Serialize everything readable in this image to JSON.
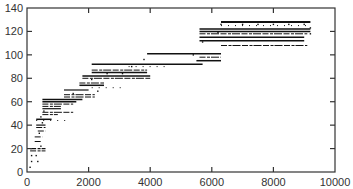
{
  "chart_data": {
    "type": "scatter",
    "title": "",
    "xlabel": "",
    "ylabel": "",
    "xlim": [
      0,
      10000
    ],
    "ylim": [
      0,
      140
    ],
    "grid": false,
    "legend": null,
    "x_ticks": [
      0,
      2000,
      4000,
      6000,
      8000,
      10000
    ],
    "y_ticks": [
      0,
      20,
      40,
      60,
      80,
      100,
      120,
      140
    ],
    "x_tick_labels": [
      "0",
      "2000",
      "4000",
      "6000",
      "8000",
      "10000"
    ],
    "y_tick_labels": [
      "0",
      "20",
      "40",
      "60",
      "80",
      "100",
      "120",
      "140"
    ],
    "segments": [
      {
        "y": 128,
        "x_start": 6300,
        "x_end": 9200,
        "style": "solid",
        "weight": 2
      },
      {
        "y": 125,
        "x_start": 6300,
        "x_end": 9200,
        "style": "dots",
        "weight": 1
      },
      {
        "y": 122,
        "x_start": 5600,
        "x_end": 9200,
        "style": "solid",
        "weight": 1.5
      },
      {
        "y": 120,
        "x_start": 5600,
        "x_end": 9200,
        "style": "solid",
        "weight": 1.5
      },
      {
        "y": 118,
        "x_start": 5600,
        "x_end": 9100,
        "style": "dashed",
        "weight": 1
      },
      {
        "y": 115,
        "x_start": 5600,
        "x_end": 9000,
        "style": "solid",
        "weight": 1.5
      },
      {
        "y": 112,
        "x_start": 5600,
        "x_end": 9000,
        "style": "solid",
        "weight": 1.5
      },
      {
        "y": 108,
        "x_start": 6300,
        "x_end": 9100,
        "style": "dashed",
        "weight": 1
      },
      {
        "y": 101,
        "x_start": 3900,
        "x_end": 6300,
        "style": "solid",
        "weight": 1.5
      },
      {
        "y": 98,
        "x_start": 5600,
        "x_end": 6300,
        "style": "dashed",
        "weight": 1
      },
      {
        "y": 95,
        "x_start": 5500,
        "x_end": 6300,
        "style": "solid",
        "weight": 1.5
      },
      {
        "y": 92,
        "x_start": 2100,
        "x_end": 5700,
        "style": "solid",
        "weight": 1.5
      },
      {
        "y": 90,
        "x_start": 3300,
        "x_end": 4500,
        "style": "dots",
        "weight": 1
      },
      {
        "y": 87,
        "x_start": 2100,
        "x_end": 3900,
        "style": "dashed",
        "weight": 1
      },
      {
        "y": 85,
        "x_start": 2100,
        "x_end": 3900,
        "style": "solid",
        "weight": 1.5
      },
      {
        "y": 82,
        "x_start": 1800,
        "x_end": 4000,
        "style": "solid",
        "weight": 1.5
      },
      {
        "y": 80,
        "x_start": 1800,
        "x_end": 4000,
        "style": "dashed",
        "weight": 1
      },
      {
        "y": 76,
        "x_start": 1700,
        "x_end": 2500,
        "style": "dashed",
        "weight": 1
      },
      {
        "y": 74,
        "x_start": 1700,
        "x_end": 2500,
        "style": "solid",
        "weight": 1.5
      },
      {
        "y": 72,
        "x_start": 2100,
        "x_end": 3200,
        "style": "dots",
        "weight": 1
      },
      {
        "y": 70,
        "x_start": 1200,
        "x_end": 2000,
        "style": "solid",
        "weight": 1.2
      },
      {
        "y": 66,
        "x_start": 1200,
        "x_end": 2200,
        "style": "dashed",
        "weight": 1
      },
      {
        "y": 64,
        "x_start": 1200,
        "x_end": 2200,
        "style": "dashed",
        "weight": 1
      },
      {
        "y": 62,
        "x_start": 500,
        "x_end": 1800,
        "style": "solid",
        "weight": 1.5
      },
      {
        "y": 60,
        "x_start": 500,
        "x_end": 1600,
        "style": "solid",
        "weight": 1.5
      },
      {
        "y": 58,
        "x_start": 500,
        "x_end": 1500,
        "style": "dashed",
        "weight": 1
      },
      {
        "y": 56,
        "x_start": 500,
        "x_end": 1100,
        "style": "dashed",
        "weight": 1
      },
      {
        "y": 54,
        "x_start": 500,
        "x_end": 1100,
        "style": "solid",
        "weight": 1.2
      },
      {
        "y": 51,
        "x_start": 500,
        "x_end": 1500,
        "style": "dashed",
        "weight": 1
      },
      {
        "y": 49,
        "x_start": 500,
        "x_end": 1000,
        "style": "dashed",
        "weight": 1
      },
      {
        "y": 45,
        "x_start": 300,
        "x_end": 800,
        "style": "solid",
        "weight": 1.5
      },
      {
        "y": 44,
        "x_start": 300,
        "x_end": 1400,
        "style": "dots",
        "weight": 1
      },
      {
        "y": 40,
        "x_start": 300,
        "x_end": 600,
        "style": "solid",
        "weight": 1.2
      },
      {
        "y": 38,
        "x_start": 300,
        "x_end": 600,
        "style": "dashed",
        "weight": 1
      },
      {
        "y": 35,
        "x_start": 350,
        "x_end": 600,
        "style": "dashed",
        "weight": 1
      },
      {
        "y": 30,
        "x_start": 250,
        "x_end": 500,
        "style": "dashed",
        "weight": 1
      },
      {
        "y": 26,
        "x_start": 250,
        "x_end": 450,
        "style": "dashed",
        "weight": 1
      },
      {
        "y": 20,
        "x_start": 100,
        "x_end": 600,
        "style": "dashed",
        "weight": 1.2
      },
      {
        "y": 18,
        "x_start": 100,
        "x_end": 600,
        "style": "dashed",
        "weight": 1
      }
    ],
    "points": [
      {
        "x": 150,
        "y": 14
      },
      {
        "x": 300,
        "y": 14
      },
      {
        "x": 150,
        "y": 9
      },
      {
        "x": 350,
        "y": 9
      },
      {
        "x": 100,
        "y": 4
      },
      {
        "x": 450,
        "y": 22
      },
      {
        "x": 400,
        "y": 33
      },
      {
        "x": 500,
        "y": 42
      },
      {
        "x": 450,
        "y": 47
      },
      {
        "x": 550,
        "y": 52
      },
      {
        "x": 6300,
        "y": 126
      },
      {
        "x": 7000,
        "y": 126
      },
      {
        "x": 7500,
        "y": 126
      },
      {
        "x": 8000,
        "y": 126
      },
      {
        "x": 8500,
        "y": 126
      },
      {
        "x": 9000,
        "y": 126
      },
      {
        "x": 9200,
        "y": 123
      },
      {
        "x": 9200,
        "y": 118
      },
      {
        "x": 6200,
        "y": 119
      },
      {
        "x": 5700,
        "y": 111
      },
      {
        "x": 5400,
        "y": 100
      },
      {
        "x": 3800,
        "y": 96
      },
      {
        "x": 3400,
        "y": 90
      },
      {
        "x": 2600,
        "y": 84
      },
      {
        "x": 3100,
        "y": 84
      },
      {
        "x": 2100,
        "y": 79
      },
      {
        "x": 1500,
        "y": 67
      },
      {
        "x": 2300,
        "y": 69
      }
    ]
  }
}
